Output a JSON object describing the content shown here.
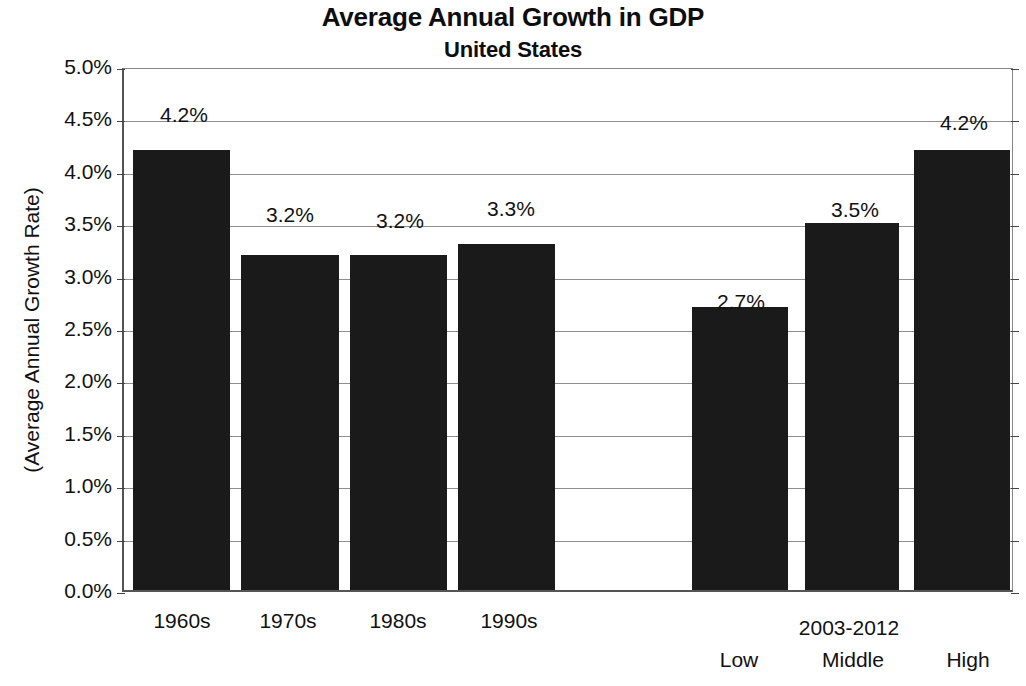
{
  "chart_data": {
    "type": "bar",
    "title": "Average Annual Growth in GDP",
    "subtitle": "United States",
    "xlabel": "",
    "ylabel": "(Average Annual Growth Rate)",
    "ylim": [
      0,
      5
    ],
    "grid": true,
    "legend": "none",
    "categories": [
      "1960s",
      "1970s",
      "1980s",
      "1990s",
      "",
      "Low",
      "Middle",
      "High"
    ],
    "values": [
      4.2,
      3.2,
      3.2,
      3.3,
      null,
      2.7,
      3.5,
      4.2
    ],
    "value_labels": [
      "4.2%",
      "3.2%",
      "3.2%",
      "3.3%",
      "",
      "2.7%",
      "3.5%",
      "4.2%"
    ],
    "group_labels": [
      {
        "text": "2003-2012",
        "spans": [
          "Low",
          "Middle",
          "High"
        ]
      }
    ],
    "ytick_labels": [
      "5.0%",
      "4.5%",
      "4.0%",
      "3.5%",
      "3.0%",
      "2.5%",
      "2.0%",
      "1.5%",
      "1.0%",
      "0.5%",
      "0.0%"
    ],
    "ytick_values": [
      5.0,
      4.5,
      4.0,
      3.5,
      3.0,
      2.5,
      2.0,
      1.5,
      1.0,
      0.5,
      0.0
    ],
    "bar_color": "#1a1a1a",
    "bars": [
      {
        "key": "1960s",
        "label": "1960s",
        "value": 4.2,
        "value_label": "4.2%",
        "x": 9,
        "width": 97,
        "label_center": 60,
        "label_top": 34,
        "tick_center": 60
      },
      {
        "key": "1970s",
        "label": "1970s",
        "value": 3.2,
        "value_label": "3.2%",
        "x": 117,
        "width": 98,
        "label_center": 166,
        "label_top": 134,
        "tick_center": 166
      },
      {
        "key": "1980s",
        "label": "1980s",
        "value": 3.2,
        "value_label": "3.2%",
        "x": 226,
        "width": 97,
        "label_center": 276,
        "label_top": 140,
        "tick_center": 276
      },
      {
        "key": "1990s",
        "label": "1990s",
        "value": 3.3,
        "value_label": "3.3%",
        "x": 334,
        "width": 97,
        "label_center": 387,
        "label_top": 128,
        "tick_center": 387
      },
      {
        "key": "gap",
        "label": "",
        "value": 0,
        "value_label": "",
        "x": 443,
        "width": 0,
        "label_center": 494,
        "label_top": 0,
        "tick_center": 494
      },
      {
        "key": "Low",
        "label": "Low",
        "value": 2.7,
        "value_label": "2.7%",
        "x": 568,
        "width": 96,
        "label_center": 617,
        "label_top": 221,
        "tick_center": 617
      },
      {
        "key": "Middle",
        "label": "Middle",
        "value": 3.5,
        "value_label": "3.5%",
        "x": 681,
        "width": 94,
        "label_center": 731,
        "label_top": 129,
        "tick_center": 731
      },
      {
        "key": "High",
        "label": "High",
        "value": 4.2,
        "value_label": "4.2%",
        "x": 790,
        "width": 96,
        "label_center": 840,
        "label_top": 42,
        "tick_center": 846
      }
    ]
  }
}
